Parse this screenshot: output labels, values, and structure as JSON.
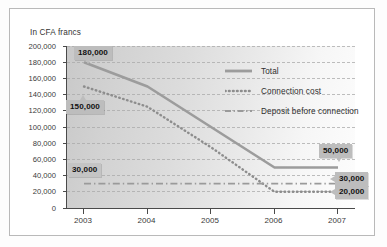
{
  "chart_data": {
    "type": "line",
    "title": "In CFA francs",
    "xlabel": "",
    "ylabel": "",
    "categories": [
      "2003",
      "2004",
      "2005",
      "2006",
      "2007"
    ],
    "x": [
      2003,
      2004,
      2005,
      2006,
      2007
    ],
    "ylim": [
      0,
      200000
    ],
    "ytick_labels": [
      "200,000",
      "180,000",
      "160,000",
      "140,000",
      "120,000",
      "100,000",
      "80,000",
      "60,000",
      "40,000",
      "20,000",
      "0"
    ],
    "ytick_values": [
      200000,
      180000,
      160000,
      140000,
      120000,
      100000,
      80000,
      60000,
      40000,
      20000,
      0
    ],
    "grid": true,
    "legend_position": "upper-right",
    "series": [
      {
        "name": "Total",
        "style": "solid",
        "color": "#9a9a9a",
        "values": [
          180000,
          150000,
          100000,
          50000,
          50000
        ]
      },
      {
        "name": "Connection cost",
        "style": "dotted",
        "color": "#8f8f8f",
        "values": [
          150000,
          125000,
          75000,
          20000,
          20000
        ]
      },
      {
        "name": "Deposit before connection",
        "style": "dash-dot",
        "color": "#9a9a9a",
        "values": [
          30000,
          30000,
          30000,
          30000,
          30000
        ]
      }
    ],
    "annotations": [
      {
        "id": "total-start",
        "label": "180,000",
        "series": "Total",
        "at_x": "2003",
        "value": 180000
      },
      {
        "id": "connection-start",
        "label": "150,000",
        "series": "Connection cost",
        "at_x": "2003",
        "value": 150000
      },
      {
        "id": "deposit-left",
        "label": "30,000",
        "series": "Deposit before connection",
        "at_x": "2003",
        "value": 30000
      },
      {
        "id": "total-end",
        "label": "50,000",
        "series": "Total",
        "at_x": "2007",
        "value": 50000
      },
      {
        "id": "deposit-end",
        "label": "30,000",
        "series": "Deposit before connection",
        "at_x": "2007",
        "value": 30000
      },
      {
        "id": "connection-end",
        "label": "20,000",
        "series": "Connection cost",
        "at_x": "2007",
        "value": 20000
      }
    ]
  }
}
